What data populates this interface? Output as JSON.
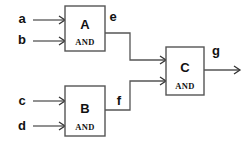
{
  "diagram": {
    "colors": {
      "background": "#ffffff",
      "wire": "#555555",
      "box_stroke": "#555555",
      "text": "#111111"
    },
    "gates": [
      {
        "id": "A",
        "name": "A",
        "type": "AND",
        "x": 65,
        "y": 6,
        "width": 40,
        "height": 45,
        "inputs": [
          "a",
          "b"
        ],
        "output": "e"
      },
      {
        "id": "B",
        "name": "B",
        "type": "AND",
        "x": 65,
        "y": 86,
        "width": 40,
        "height": 50,
        "inputs": [
          "c",
          "d"
        ],
        "output": "f"
      },
      {
        "id": "C",
        "name": "C",
        "type": "AND",
        "x": 166,
        "y": 47,
        "width": 38,
        "height": 48,
        "inputs": [
          "e",
          "f"
        ],
        "output": "g"
      }
    ],
    "signals": [
      {
        "id": "a",
        "label": "a",
        "kind": "input",
        "label_x": 22,
        "label_y": 23
      },
      {
        "id": "b",
        "label": "b",
        "kind": "input",
        "label_x": 22,
        "label_y": 44
      },
      {
        "id": "c",
        "label": "c",
        "kind": "input",
        "label_x": 22,
        "label_y": 105
      },
      {
        "id": "d",
        "label": "d",
        "kind": "input",
        "label_x": 22,
        "label_y": 130
      },
      {
        "id": "e",
        "label": "e",
        "kind": "internal",
        "label_x": 113,
        "label_y": 21
      },
      {
        "id": "f",
        "label": "f",
        "kind": "internal",
        "label_x": 119,
        "label_y": 105
      },
      {
        "id": "g",
        "label": "g",
        "kind": "output",
        "label_x": 216,
        "label_y": 55
      }
    ],
    "wires": [
      {
        "id": "wire-a",
        "signal": "a",
        "path": "M33,20 L64,20"
      },
      {
        "id": "wire-b",
        "signal": "b",
        "path": "M33,41 L64,41"
      },
      {
        "id": "wire-c",
        "signal": "c",
        "path": "M33,101 L64,101"
      },
      {
        "id": "wire-d",
        "signal": "d",
        "path": "M33,126 L64,126"
      },
      {
        "id": "wire-e",
        "signal": "e",
        "path": "M105,33 L130,33 L130,60 L165,60"
      },
      {
        "id": "wire-f",
        "signal": "f",
        "path": "M105,110 L130,110 L130,81 L165,81"
      },
      {
        "id": "wire-g",
        "signal": "g",
        "path": "M204,70 L239,70"
      }
    ],
    "arrow_heads": [
      {
        "id": "arrow-a",
        "points": "59,16 65,20 59,24"
      },
      {
        "id": "arrow-b",
        "points": "59,37 65,41 59,45"
      },
      {
        "id": "arrow-c",
        "points": "59,97 65,101 59,105"
      },
      {
        "id": "arrow-d",
        "points": "59,122 65,126 59,130"
      },
      {
        "id": "arrow-e",
        "points": "160,56 166,60 160,64"
      },
      {
        "id": "arrow-f",
        "points": "160,77 166,81 160,85"
      },
      {
        "id": "arrow-g",
        "points": "234,66 240,70 234,74"
      }
    ]
  }
}
